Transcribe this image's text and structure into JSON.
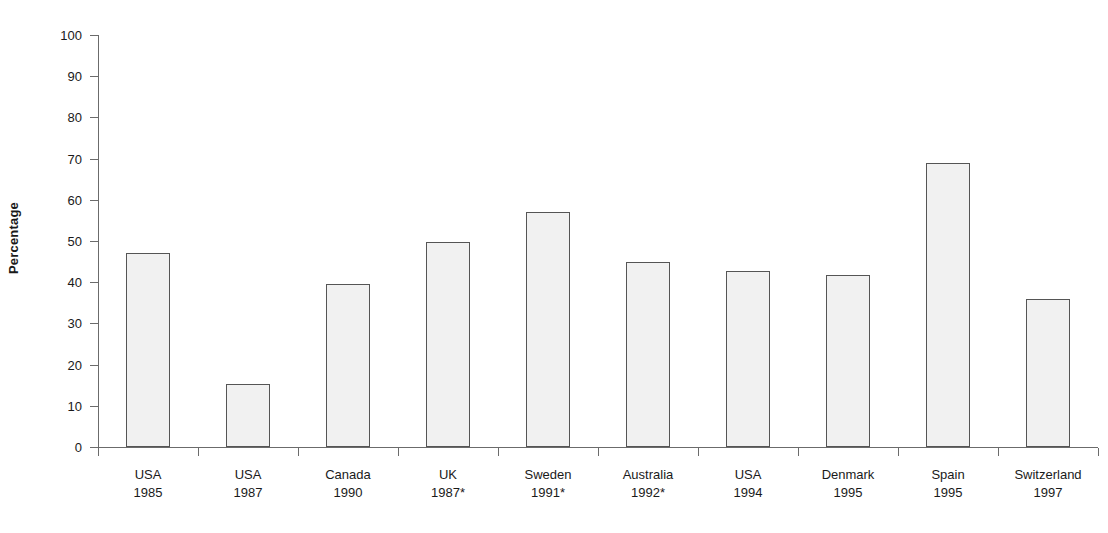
{
  "chart_data": {
    "type": "bar",
    "title": "",
    "xlabel": "",
    "ylabel": "Percentage",
    "ylim": [
      0,
      100
    ],
    "ytick_step": 10,
    "yticks": [
      0,
      10,
      20,
      30,
      40,
      50,
      60,
      70,
      80,
      90,
      100
    ],
    "grid": false,
    "legend": false,
    "categories": [
      "USA 1985",
      "USA 1987",
      "Canada 1990",
      "UK 1987*",
      "Sweden 1991*",
      "Australia 1992*",
      "USA 1994",
      "Denmark 1995",
      "Spain 1995",
      "Switzerland 1997"
    ],
    "category_parts": [
      {
        "name": "USA",
        "year": "1985"
      },
      {
        "name": "USA",
        "year": "1987"
      },
      {
        "name": "Canada",
        "year": "1990"
      },
      {
        "name": "UK",
        "year": "1987*"
      },
      {
        "name": "Sweden",
        "year": "1991*"
      },
      {
        "name": "Australia",
        "year": "1992*"
      },
      {
        "name": "USA",
        "year": "1994"
      },
      {
        "name": "Denmark",
        "year": "1995"
      },
      {
        "name": "Spain",
        "year": "1995"
      },
      {
        "name": "Switzerland",
        "year": "1997"
      }
    ],
    "values": [
      47,
      15.3,
      39.5,
      49.8,
      57,
      44.8,
      42.8,
      41.8,
      69,
      36
    ],
    "bar_fill": "#f1f1f1",
    "bar_border": "#555555",
    "axis_color": "#6b6b6b",
    "text_color": "#1a1a1a"
  }
}
